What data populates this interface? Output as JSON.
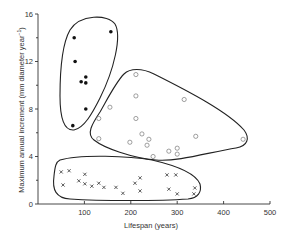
{
  "chart_data": {
    "type": "scatter",
    "title": "",
    "xlabel": "Lifespan (years)",
    "ylabel": "Maximum annual increment (mm diameter year⁻¹)",
    "xlim": [
      0,
      500
    ],
    "ylim": [
      0,
      16
    ],
    "x_ticks": [
      100,
      200,
      300,
      400,
      500
    ],
    "x_tick_labels": [
      "100",
      "200",
      "300",
      "400",
      "500"
    ],
    "y_ticks": [
      0,
      4,
      8,
      12,
      16
    ],
    "y_tick_labels": [
      "0",
      "4",
      "8",
      "12",
      "16"
    ],
    "y_minor_ticks": [
      2,
      6,
      10,
      14
    ],
    "grid": false,
    "legend": null,
    "series": [
      {
        "name": "group-filled-circles",
        "marker": "filled-circle",
        "points": [
          [
            78,
            14.0
          ],
          [
            157,
            14.5
          ],
          [
            80,
            12.0
          ],
          [
            93,
            10.3
          ],
          [
            103,
            10.7
          ],
          [
            103,
            10.2
          ],
          [
            103,
            8.0
          ],
          [
            75,
            6.6
          ]
        ]
      },
      {
        "name": "group-open-circles",
        "marker": "open-circle",
        "points": [
          [
            211,
            10.9
          ],
          [
            211,
            9.1
          ],
          [
            315,
            8.8
          ],
          [
            155,
            8.15
          ],
          [
            131,
            7.2
          ],
          [
            211,
            7.2
          ],
          [
            131,
            5.5
          ],
          [
            224,
            5.9
          ],
          [
            198,
            5.2
          ],
          [
            239,
            5.45
          ],
          [
            235,
            4.95
          ],
          [
            248,
            4.0
          ],
          [
            282,
            4.45
          ],
          [
            300,
            4.7
          ],
          [
            300,
            4.2
          ],
          [
            340,
            5.7
          ],
          [
            442,
            5.45
          ]
        ]
      },
      {
        "name": "group-crosses",
        "marker": "cross",
        "points": [
          [
            50,
            2.7
          ],
          [
            67,
            2.8
          ],
          [
            54,
            1.6
          ],
          [
            88,
            1.95
          ],
          [
            101,
            2.5
          ],
          [
            101,
            1.7
          ],
          [
            116,
            1.5
          ],
          [
            131,
            1.75
          ],
          [
            142,
            1.4
          ],
          [
            168,
            1.4
          ],
          [
            183,
            0.9
          ],
          [
            209,
            1.75
          ],
          [
            220,
            2.2
          ],
          [
            220,
            1.1
          ],
          [
            278,
            2.45
          ],
          [
            297,
            2.45
          ],
          [
            282,
            1.25
          ],
          [
            300,
            0.85
          ],
          [
            338,
            1.35
          ],
          [
            336,
            0.85
          ]
        ]
      }
    ],
    "annotations": [
      "Closed envelope around filled-circle group",
      "Closed envelope around open-circle group",
      "Closed envelope around cross group"
    ]
  },
  "axes": {
    "x_title": "Lifespan (years)",
    "y_title": "Maximum annual increment (mm diameter year",
    "y_title_superscript": "−1",
    "y_title_close": ")"
  }
}
